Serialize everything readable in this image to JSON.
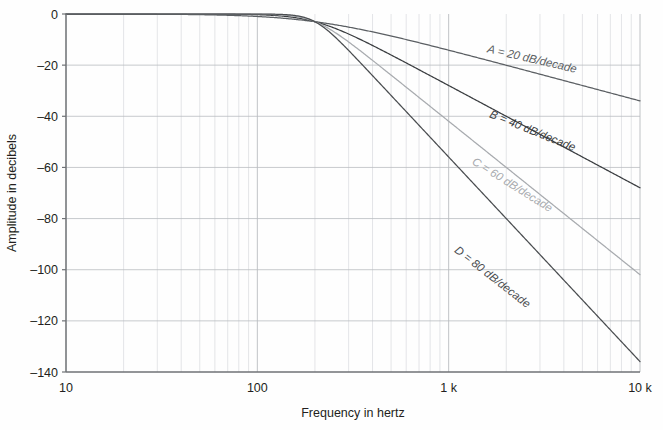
{
  "figure": {
    "background_color": "#fefefe",
    "plot_area": {
      "left": 66,
      "top": 14,
      "right": 640,
      "bottom": 372
    }
  },
  "axes": {
    "x": {
      "title": "Frequency in hertz",
      "scale": "log",
      "min": 10,
      "max": 10000,
      "major_ticks": [
        {
          "value": 10,
          "label": "10"
        },
        {
          "value": 100,
          "label": "100"
        },
        {
          "value": 1000,
          "label": "1 k"
        },
        {
          "value": 10000,
          "label": "10 k"
        }
      ],
      "minor_ticks_per_decade": [
        2,
        3,
        4,
        5,
        6,
        7,
        8,
        9
      ]
    },
    "y": {
      "title": "Amplitude in decibels",
      "scale": "linear",
      "min": -140,
      "max": 0,
      "major_ticks": [
        {
          "value": 0,
          "label": "0"
        },
        {
          "value": -20,
          "label": "–20"
        },
        {
          "value": -40,
          "label": "–40"
        },
        {
          "value": -60,
          "label": "–60"
        },
        {
          "value": -80,
          "label": "–80"
        },
        {
          "value": -100,
          "label": "–100"
        },
        {
          "value": -120,
          "label": "–120"
        },
        {
          "value": -140,
          "label": "–140"
        }
      ]
    }
  },
  "style": {
    "grid_major_color": "#b9bcc0",
    "grid_minor_color": "#d8dade",
    "axis_line_color": "#6f7276",
    "curve_colors": {
      "A": "#5b5f63",
      "B": "#3a3d40",
      "C": "#a8abaf",
      "D": "#4a4d50"
    }
  },
  "chart_data": {
    "type": "line",
    "title": "",
    "xlabel": "Frequency in hertz",
    "ylabel": "Amplitude in decibels",
    "xscale": "log",
    "xlim": [
      10,
      10000
    ],
    "ylim": [
      -140,
      0
    ],
    "grid": true,
    "legend": "inline-annotations",
    "cutoff_hz": 200,
    "x": [
      10,
      20,
      30,
      50,
      70,
      100,
      150,
      200,
      300,
      400,
      500,
      700,
      1000,
      1500,
      2000,
      3000,
      4000,
      5000,
      7000,
      10000
    ],
    "series": [
      {
        "name": "A",
        "label": "A = 20 dB/decade",
        "order": 1,
        "slope_db_per_decade": 20,
        "color": "#5b5f63",
        "values": [
          -0.01,
          -0.04,
          -0.1,
          -0.27,
          -0.5,
          -1.0,
          -2.1,
          -3.0,
          -5.7,
          -8.1,
          -10.2,
          -13.6,
          -16.5,
          -20.0,
          -22.4,
          -25.8,
          -28.2,
          -30.0,
          -32.7,
          -35.7
        ]
      },
      {
        "name": "B",
        "label": "B = 40 dB/decade",
        "order": 2,
        "slope_db_per_decade": 40,
        "color": "#3a3d40",
        "values": [
          -0.0,
          -0.01,
          -0.04,
          -0.11,
          -0.41,
          -0.53,
          -2.2,
          -3.0,
          -9.0,
          -14.5,
          -18.9,
          -25.6,
          -32.1,
          -39.4,
          -44.5,
          -51.5,
          -56.5,
          -60.3,
          -65.7,
          -71.4
        ]
      },
      {
        "name": "C",
        "label": "C = 60 dB/decade",
        "order": 3,
        "slope_db_per_decade": 60,
        "color": "#a8abaf",
        "values": [
          -0.0,
          -0.0,
          -0.0,
          -0.01,
          -0.07,
          -0.26,
          -1.7,
          -3.0,
          -12.6,
          -21.0,
          -27.8,
          -38.1,
          -47.9,
          -58.8,
          -66.5,
          -77.0,
          -84.4,
          -90.1,
          -98.2,
          -106.8
        ]
      },
      {
        "name": "D",
        "label": "D = 80 dB/decade",
        "order": 4,
        "slope_db_per_decade": 80,
        "color": "#4a4d50",
        "values": [
          -0.0,
          -0.0,
          -0.0,
          -0.0,
          -0.01,
          -0.11,
          -1.4,
          -3.0,
          -16.2,
          -27.4,
          -36.5,
          -50.4,
          -63.6,
          -78.2,
          -88.5,
          -102.5,
          -112.4,
          -120.0,
          -130.8,
          -142.3
        ]
      }
    ],
    "annotations": [
      {
        "text": "A = 20 dB/decade",
        "series": "A",
        "x": 2700,
        "y": -19,
        "rotation": 13
      },
      {
        "text": "B = 40 dB/decade",
        "series": "B",
        "x": 2700,
        "y": -47,
        "rotation": 22
      },
      {
        "text": "C = 60 dB/decade",
        "series": "C",
        "x": 2100,
        "y": -68,
        "rotation": 32
      },
      {
        "text": "D = 80 dB/decade",
        "series": "D",
        "x": 1650,
        "y": -104,
        "rotation": 38
      }
    ]
  }
}
